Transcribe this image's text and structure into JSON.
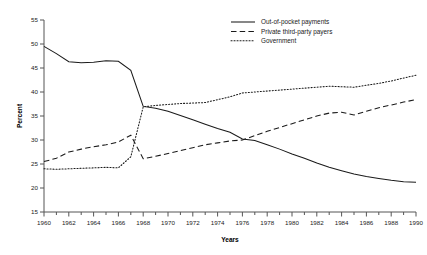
{
  "chart_data": {
    "type": "line",
    "title": "",
    "xlabel": "Years",
    "ylabel": "Percent",
    "xlim": [
      1960,
      1990
    ],
    "ylim": [
      15,
      55
    ],
    "yticks": [
      15,
      20,
      25,
      30,
      35,
      40,
      45,
      50,
      55
    ],
    "xticks": [
      1960,
      1962,
      1964,
      1966,
      1968,
      1970,
      1972,
      1974,
      1976,
      1978,
      1980,
      1982,
      1984,
      1986,
      1988,
      1990
    ],
    "xticks_minor": [
      1961,
      1963,
      1965,
      1967,
      1969,
      1971,
      1973,
      1975,
      1977,
      1979,
      1981,
      1983,
      1985,
      1987,
      1989
    ],
    "grid": false,
    "legend_position": "top-right",
    "x": [
      1960,
      1961,
      1962,
      1963,
      1964,
      1965,
      1966,
      1967,
      1968,
      1969,
      1970,
      1971,
      1972,
      1973,
      1974,
      1975,
      1976,
      1977,
      1978,
      1979,
      1980,
      1981,
      1982,
      1983,
      1984,
      1985,
      1986,
      1987,
      1988,
      1989,
      1990
    ],
    "series": [
      {
        "name": "Out-of-pocket payments",
        "style": "solid",
        "values": [
          49.5,
          48.0,
          46.3,
          46.1,
          46.2,
          46.5,
          46.4,
          44.5,
          37.0,
          36.6,
          36.0,
          35.1,
          34.2,
          33.3,
          32.4,
          31.6,
          30.2,
          29.9,
          29.0,
          28.1,
          27.1,
          26.2,
          25.2,
          24.3,
          23.6,
          22.9,
          22.4,
          22.0,
          21.6,
          21.3,
          21.2
        ]
      },
      {
        "name": "Private third-party payers",
        "style": "dashed",
        "values": [
          25.5,
          26.2,
          27.5,
          28.1,
          28.6,
          29.0,
          29.6,
          31.0,
          26.1,
          26.6,
          27.2,
          27.8,
          28.4,
          29.0,
          29.4,
          29.8,
          30.0,
          30.9,
          31.8,
          32.6,
          33.4,
          34.2,
          35.0,
          35.6,
          35.8,
          35.2,
          36.0,
          36.7,
          37.3,
          37.9,
          38.4
        ]
      },
      {
        "name": "Government",
        "style": "dotted",
        "values": [
          24.0,
          23.9,
          24.0,
          24.1,
          24.2,
          24.3,
          24.2,
          26.5,
          36.9,
          37.2,
          37.4,
          37.6,
          37.7,
          37.8,
          38.4,
          39.0,
          39.8,
          40.0,
          40.2,
          40.4,
          40.6,
          40.8,
          41.0,
          41.2,
          41.1,
          41.0,
          41.4,
          41.8,
          42.3,
          42.9,
          43.5
        ]
      }
    ]
  },
  "legend": {
    "items": [
      {
        "label": "Out-of-pocket payments",
        "style": "solid"
      },
      {
        "label": "Private third-party payers",
        "style": "dashed"
      },
      {
        "label": "Government",
        "style": "dotted"
      }
    ]
  }
}
